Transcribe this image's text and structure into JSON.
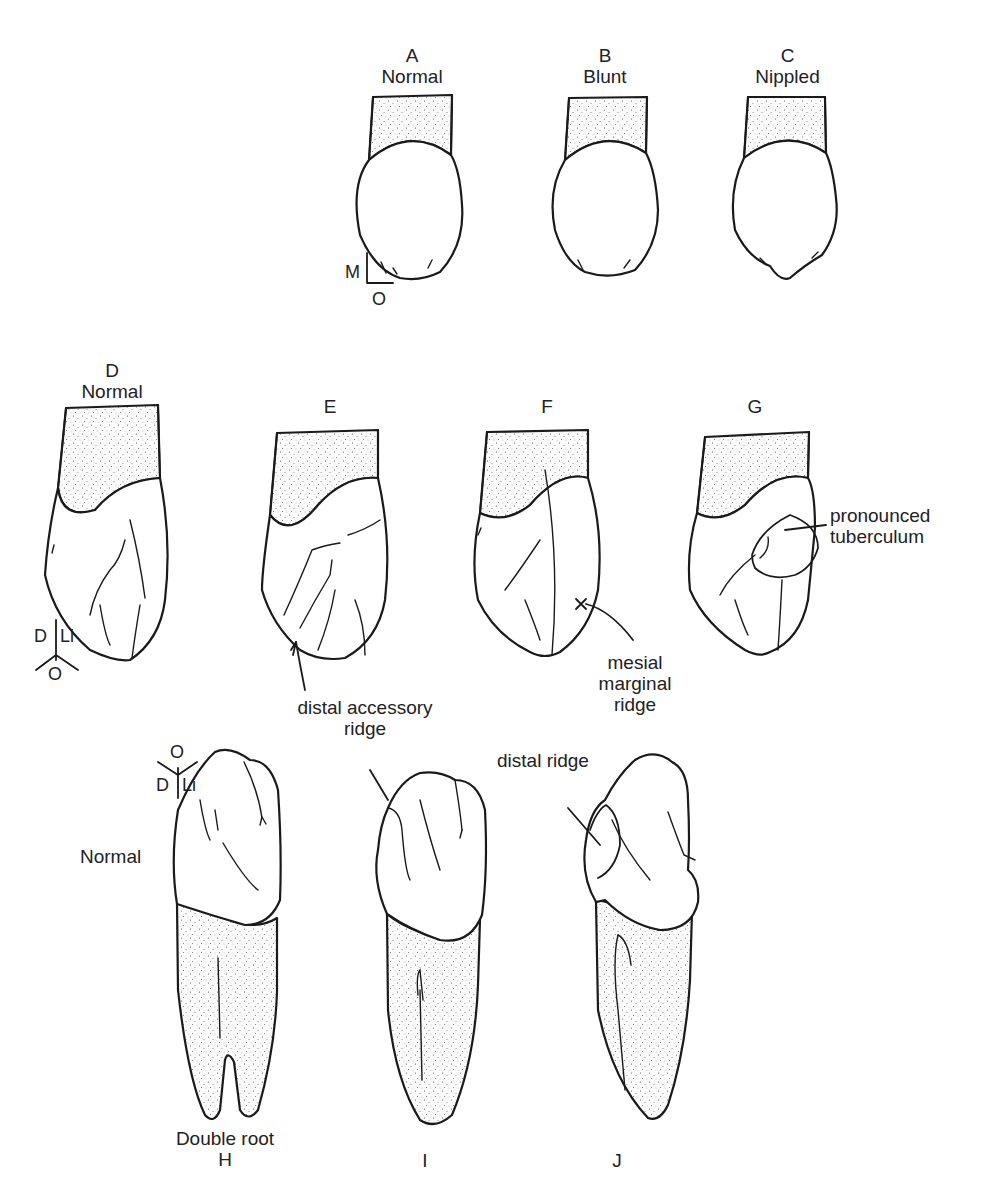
{
  "figure": {
    "row1": {
      "view_axes": {
        "vertical": "M",
        "horizontal": "O"
      },
      "panels": [
        {
          "letter": "A",
          "caption": "Normal"
        },
        {
          "letter": "B",
          "caption": "Blunt"
        },
        {
          "letter": "C",
          "caption": "Nippled"
        }
      ]
    },
    "row2": {
      "view_axes": {
        "left": "D",
        "right": "Li",
        "bottom": "O"
      },
      "panels": [
        {
          "letter": "D",
          "caption": "Normal"
        },
        {
          "letter": "E",
          "caption": ""
        },
        {
          "letter": "F",
          "caption": ""
        },
        {
          "letter": "G",
          "caption": ""
        }
      ],
      "annotations": {
        "distal_accessory_ridge": "distal accessory ridge",
        "distal_accessory_ridge_line1": "distal accessory",
        "distal_accessory_ridge_line2": "ridge",
        "mesial_marginal_ridge_line1": "mesial",
        "mesial_marginal_ridge_line2": "marginal",
        "mesial_marginal_ridge_line3": "ridge",
        "mesial_marginal_marker": "x",
        "pronounced_tuberculum_line1": "pronounced",
        "pronounced_tuberculum_line2": "tuberculum"
      }
    },
    "row3": {
      "view_axes": {
        "top": "O",
        "left": "D",
        "right": "Li"
      },
      "side_label": "Normal",
      "panels": [
        {
          "letter": "H",
          "caption": "Double root"
        },
        {
          "letter": "I",
          "caption": ""
        },
        {
          "letter": "J",
          "caption": ""
        }
      ],
      "annotations": {
        "distal_accessory_ridge_line1": "distal accessory",
        "distal_accessory_ridge_line2": "ridge",
        "distal_ridge": "distal ridge"
      }
    }
  }
}
